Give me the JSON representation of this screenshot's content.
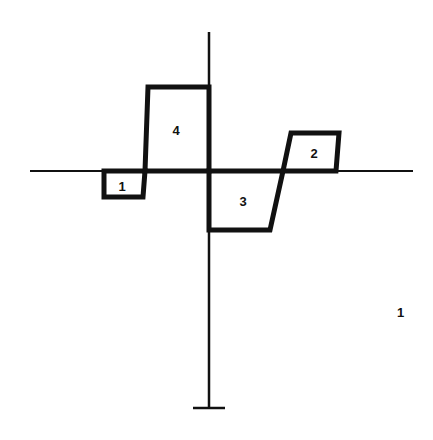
{
  "diagram": {
    "figure_number": "1",
    "colors": {
      "stroke": "#111111",
      "background": "#ffffff"
    },
    "axes": {
      "horizontal": {
        "x1": 30,
        "y1": 171,
        "x2": 413,
        "y2": 171
      },
      "vertical": {
        "x1": 209,
        "y1": 32,
        "x2": 209,
        "y2": 408
      },
      "base_tick": {
        "x1": 193,
        "y1": 408,
        "x2": 225,
        "y2": 408
      }
    },
    "regions": [
      {
        "id": "1",
        "label": "1",
        "points": "104,171 104,197 143,197 145,171",
        "label_pos": {
          "x": 122,
          "y": 186
        }
      },
      {
        "id": "2",
        "label": "2",
        "points": "283,171 291,133 339,133 336,171",
        "label_pos": {
          "x": 314,
          "y": 153
        }
      },
      {
        "id": "3",
        "label": "3",
        "points": "209,171 209,230 270,230 283,171",
        "label_pos": {
          "x": 243,
          "y": 201
        }
      },
      {
        "id": "4",
        "label": "4",
        "points": "145,171 148,87 209,87 209,171",
        "label_pos": {
          "x": 176,
          "y": 130
        }
      }
    ]
  }
}
